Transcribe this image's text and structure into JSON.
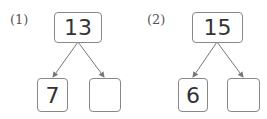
{
  "problems": [
    {
      "label": "(1)",
      "total": "13",
      "left": "7",
      "right": ""
    },
    {
      "label": "(2)",
      "total": "15",
      "left": "6",
      "right": ""
    }
  ],
  "colors": {
    "border": "#888888",
    "arrow": "#777777",
    "text": "#333333"
  }
}
